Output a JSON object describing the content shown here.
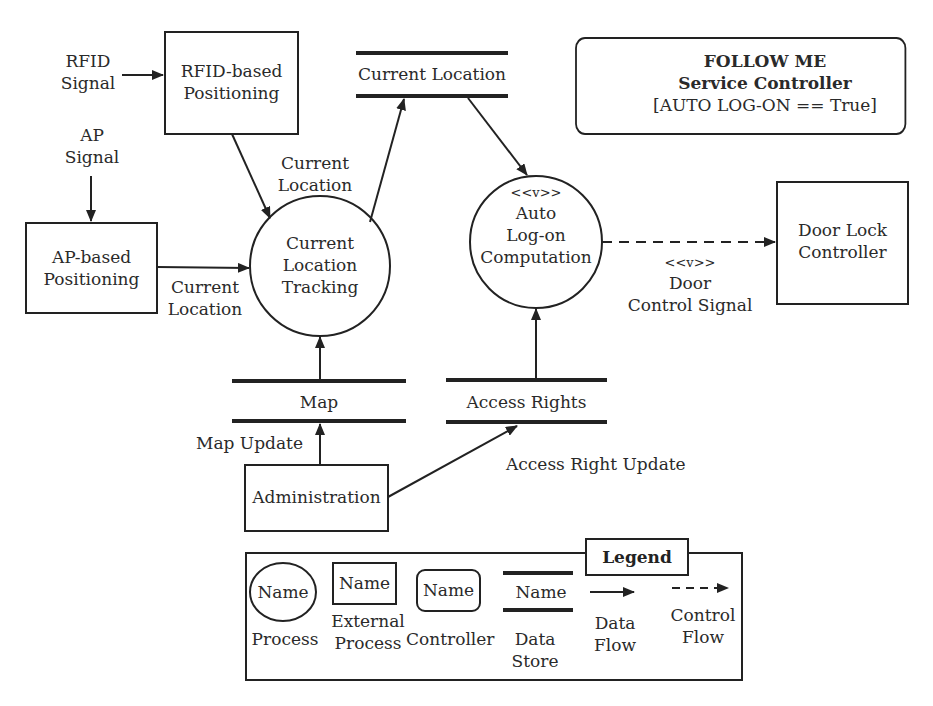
{
  "controller": {
    "line1": "FOLLOW ME",
    "line2": "Service Controller",
    "line3": "[AUTO LOG-ON == True]"
  },
  "inputs": {
    "rfid_signal": [
      "RFID",
      "Signal"
    ],
    "ap_signal": [
      "AP",
      "Signal"
    ]
  },
  "external_processes": {
    "rfid_positioning": [
      "RFID-based",
      "Positioning"
    ],
    "ap_positioning": [
      "AP-based",
      "Positioning"
    ],
    "door_lock": [
      "Door Lock",
      "Controller"
    ],
    "administration": [
      "Administration"
    ]
  },
  "processes": {
    "tracking": [
      "Current",
      "Location",
      "Tracking"
    ],
    "autologon": {
      "stereotype": "<<v>>",
      "lines": [
        "Auto",
        "Log-on",
        "Computation"
      ]
    }
  },
  "data_stores": {
    "current_location": "Current Location",
    "map": "Map",
    "access_rights": "Access Rights"
  },
  "flows": {
    "rfid_to_tracking": [
      "Current",
      "Location"
    ],
    "ap_to_tracking": [
      "Current",
      "Location"
    ],
    "door_control": {
      "stereotype": "<<v>>",
      "lines": [
        "Door",
        "Control Signal"
      ]
    },
    "map_update": "Map Update",
    "access_right_update": "Access Right Update"
  },
  "legend": {
    "title": "Legend",
    "sample": "Name",
    "items": [
      {
        "label": [
          "Process"
        ]
      },
      {
        "label": [
          "External",
          "Process"
        ]
      },
      {
        "label": [
          "Controller"
        ]
      },
      {
        "label": [
          "Data",
          "Store"
        ]
      },
      {
        "label": [
          "Data",
          "Flow"
        ]
      },
      {
        "label": [
          "Control",
          "Flow"
        ]
      }
    ]
  }
}
